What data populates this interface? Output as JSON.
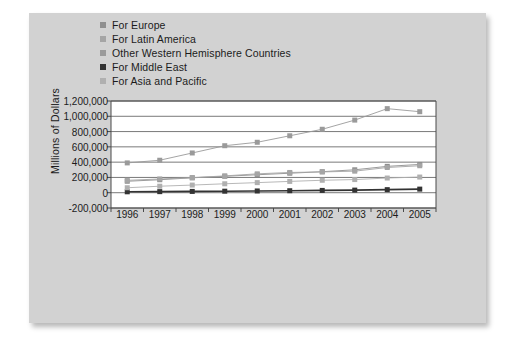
{
  "chart_data": {
    "type": "line",
    "title": "",
    "xlabel": "",
    "ylabel": "Millions of Dollars",
    "categories": [
      "1996",
      "1997",
      "1998",
      "1999",
      "2000",
      "2001",
      "2002",
      "2003",
      "2004",
      "2005"
    ],
    "x": [
      1996,
      1997,
      1998,
      1999,
      2000,
      2001,
      2002,
      2003,
      2004,
      2005
    ],
    "ylim": [
      -200000,
      1200000
    ],
    "ytick_labels": [
      "1,200,000",
      "1,000,000",
      "800,000",
      "600,000",
      "400,000",
      "200,000",
      "0",
      "-200,000"
    ],
    "ytick_values": [
      1200000,
      1000000,
      800000,
      600000,
      400000,
      200000,
      0,
      -200000
    ],
    "grid": true,
    "legend_position": "top-left",
    "series": [
      {
        "name": "For Europe",
        "color": "#8f8f8f",
        "values": [
          150000,
          170000,
          195000,
          215000,
          235000,
          255000,
          275000,
          300000,
          345000,
          370000
        ]
      },
      {
        "name": "For Latin America",
        "color": "#a5a5a5",
        "values": [
          162000,
          180000,
          197000,
          220000,
          247000,
          265000,
          272000,
          282000,
          330000,
          353000
        ]
      },
      {
        "name": "Other Western Hemisphere Countries",
        "color": "#9a9a9a",
        "values": [
          390000,
          425000,
          520000,
          615000,
          660000,
          745000,
          830000,
          950000,
          1100000,
          1060000
        ]
      },
      {
        "name": "For Middle East",
        "color": "#333333",
        "values": [
          12000,
          14000,
          17000,
          20000,
          23000,
          26000,
          30000,
          34000,
          40000,
          47000
        ]
      },
      {
        "name": "For Asia and Pacific",
        "color": "#b0b0b0",
        "values": [
          65000,
          85000,
          100000,
          117000,
          132000,
          148000,
          163000,
          172000,
          192000,
          205000
        ]
      }
    ]
  }
}
